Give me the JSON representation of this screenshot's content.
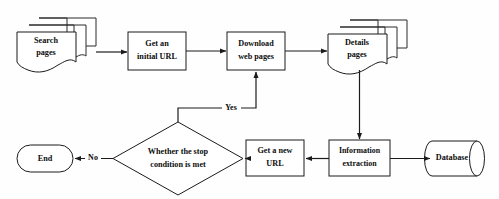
{
  "diagram": {
    "type": "flowchart",
    "background_color": "#fefefe",
    "line_color": "#1b1b1b",
    "shape_fill": "#ffffff",
    "nodes": [
      {
        "id": "search-pages",
        "shape": "multi-document",
        "line1": "Search",
        "line2": "pages"
      },
      {
        "id": "get-initial-url",
        "shape": "rectangle",
        "line1": "Get an",
        "line2": "initial URL"
      },
      {
        "id": "download-web-pages",
        "shape": "rectangle",
        "line1": "Download",
        "line2": "web pages"
      },
      {
        "id": "details-pages",
        "shape": "multi-document",
        "line1": "Details",
        "line2": "pages"
      },
      {
        "id": "information-extraction",
        "shape": "rectangle",
        "line1": "Information",
        "line2": "extraction"
      },
      {
        "id": "database",
        "shape": "cylinder",
        "line1": "Database",
        "line2": ""
      },
      {
        "id": "get-new-url",
        "shape": "rectangle",
        "line1": "Get a new",
        "line2": "URL"
      },
      {
        "id": "stop-condition",
        "shape": "diamond",
        "line1": "Whether the stop",
        "line2": "condition is met"
      },
      {
        "id": "end",
        "shape": "rounded-terminator",
        "line1": "End",
        "line2": ""
      }
    ],
    "edges": [
      {
        "id": "e1",
        "from": "search-pages",
        "to": "get-initial-url",
        "label": ""
      },
      {
        "id": "e2",
        "from": "get-initial-url",
        "to": "download-web-pages",
        "label": ""
      },
      {
        "id": "e3",
        "from": "download-web-pages",
        "to": "details-pages",
        "label": ""
      },
      {
        "id": "e4",
        "from": "details-pages",
        "to": "information-extraction",
        "label": ""
      },
      {
        "id": "e5",
        "from": "information-extraction",
        "to": "database",
        "label": ""
      },
      {
        "id": "e6",
        "from": "information-extraction",
        "to": "get-new-url",
        "label": ""
      },
      {
        "id": "e7",
        "from": "get-new-url",
        "to": "stop-condition",
        "label": ""
      },
      {
        "id": "e8",
        "from": "stop-condition",
        "to": "end",
        "label": "No"
      },
      {
        "id": "e9",
        "from": "stop-condition",
        "to": "download-web-pages",
        "label": "Yes"
      }
    ]
  }
}
